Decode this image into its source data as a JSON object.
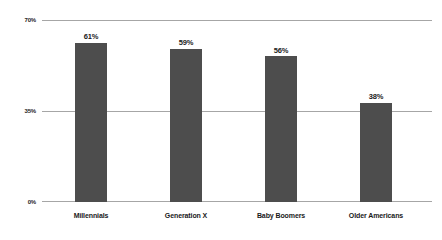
{
  "chart_data": {
    "type": "bar",
    "title": "",
    "subtitle": "",
    "xlabel": "",
    "ylabel": "",
    "categories": [
      "Millennials",
      "Generation X",
      "Baby Boomers",
      "Older Americans"
    ],
    "values": [
      61,
      59,
      56,
      38
    ],
    "value_labels": [
      "61%",
      "59%",
      "56%",
      "38%"
    ],
    "ylim": [
      0,
      70
    ],
    "yticks": [
      0,
      35,
      70
    ],
    "ytick_labels": [
      "0%",
      "35%",
      "70%"
    ],
    "grid": true,
    "grid_axis": "y",
    "legend": false,
    "legend_position": "none",
    "bar_color": "#4d4d4d",
    "gridline_color": "#a6a6a6",
    "background_color": "#ffffff",
    "text_color": "#1a1a1a"
  }
}
